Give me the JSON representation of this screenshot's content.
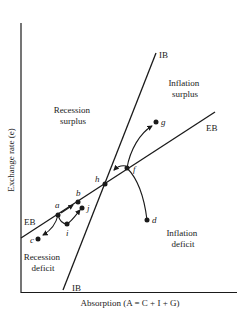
{
  "axes": {
    "y_label": "Exchange rate (e)",
    "x_label": "Absorption (A = C + I + G)"
  },
  "lines": {
    "ib": {
      "label_top": "IB",
      "label_bottom": "IB"
    },
    "eb": {
      "label_right": "EB",
      "label_left": "EB"
    }
  },
  "regions": {
    "recession_surplus": {
      "line1": "Recession",
      "line2": "surplus"
    },
    "inflation_surplus": {
      "line1": "Inflation",
      "line2": "surplus"
    },
    "inflation_deficit": {
      "line1": "Inflation",
      "line2": "deficit"
    },
    "recession_deficit": {
      "line1": "Recession",
      "line2": "deficit"
    }
  },
  "points": {
    "a": "a",
    "b": "b",
    "c": "c",
    "d": "d",
    "f": "f",
    "g": "g",
    "h": "h",
    "i": "i",
    "j": "j"
  },
  "colors": {
    "ink": "#1a1a1a",
    "background": "#ffffff"
  }
}
